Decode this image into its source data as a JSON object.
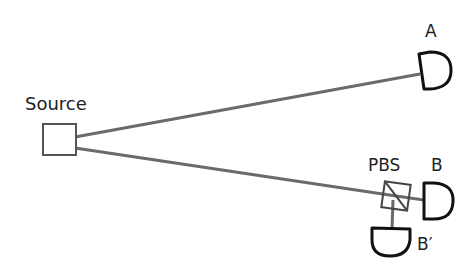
{
  "diagram": {
    "labels": {
      "source": "Source",
      "detector_a": "A",
      "pbs": "PBS",
      "detector_b": "B",
      "detector_b_prime": "B′"
    },
    "colors": {
      "beam": "#6a6a6a",
      "outline": "#111111",
      "source_box": "#555555"
    }
  }
}
